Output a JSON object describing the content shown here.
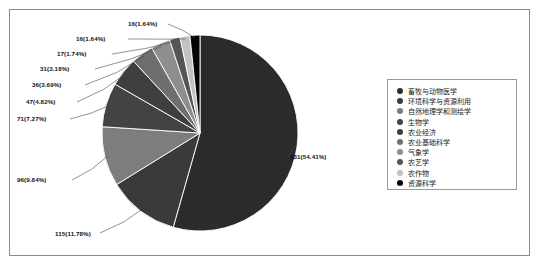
{
  "chart_data": {
    "type": "pie",
    "title": "",
    "subtitle": "",
    "xlabel": "",
    "ylabel": "",
    "legend_position": "right",
    "grid": false,
    "total": 976,
    "categories": [
      "畜牧与动物医学",
      "环境科学与资源利用",
      "自然地理学和测绘学",
      "生物学",
      "农业经济",
      "农业基础科学",
      "气象学",
      "农艺学",
      "农作物",
      "资源科学"
    ],
    "values": [
      531,
      115,
      96,
      71,
      47,
      36,
      31,
      17,
      16,
      16
    ],
    "percents": [
      54.41,
      11.78,
      9.84,
      7.27,
      4.82,
      3.69,
      3.18,
      1.74,
      1.64,
      1.64
    ],
    "colors": [
      "#2b2b2b",
      "#3a3a3a",
      "#7d7d7d",
      "#434343",
      "#3f3f3f",
      "#6e6e6e",
      "#8e8e8e",
      "#555555",
      "#c2c2c2",
      "#050505"
    ],
    "data_labels": [
      "531(54.41%)",
      "115(11.78%)",
      "96(9.84%)",
      "71(7.27%)",
      "47(4.82%)",
      "36(3.69%)",
      "31(3.18%)",
      "17(1.74%)",
      "16(1.64%)",
      "16(1.64%)"
    ]
  },
  "legend": {
    "items": [
      {
        "label": "畜牧与动物医学",
        "color": "#2b2b2b"
      },
      {
        "label": "环境科学与资源利用",
        "color": "#3a3a3a"
      },
      {
        "label": "自然地理学和测绘学",
        "color": "#7d7d7d"
      },
      {
        "label": "生物学",
        "color": "#434343"
      },
      {
        "label": "农业经济",
        "color": "#3f3f3f"
      },
      {
        "label": "农业基础科学",
        "color": "#6e6e6e"
      },
      {
        "label": "气象学",
        "color": "#8e8e8e"
      },
      {
        "label": "农艺学",
        "color": "#555555"
      },
      {
        "label": "农作物",
        "color": "#c2c2c2"
      },
      {
        "label": "资源科学",
        "color": "#050505"
      }
    ]
  }
}
